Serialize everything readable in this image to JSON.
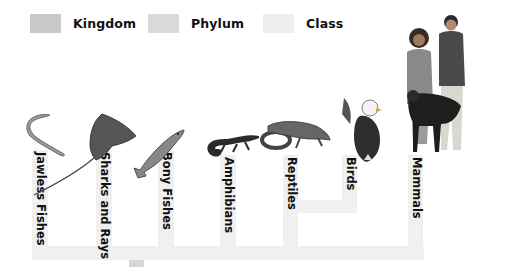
{
  "legend": [
    {
      "label": "Kingdom",
      "color": "#c9c9c9"
    },
    {
      "label": "Phylum",
      "color": "#dadada"
    },
    {
      "label": "Class",
      "color": "#eeeeee"
    }
  ],
  "branch_color": "#f0f0f0",
  "stub_color": "#d6d6d6",
  "classes": [
    {
      "label": "Jawless Fishes",
      "illustration": "lamprey"
    },
    {
      "label": "Sharks and Rays",
      "illustration": "stingray"
    },
    {
      "label": "Bony Fishes",
      "illustration": "trout"
    },
    {
      "label": "Amphibians",
      "illustration": "salamander"
    },
    {
      "label": "Reptiles",
      "illustration": "lizard-and-snake"
    },
    {
      "label": "Birds",
      "illustration": "bald-eagle"
    },
    {
      "label": "Mammals",
      "illustration": "people-and-dog"
    }
  ]
}
